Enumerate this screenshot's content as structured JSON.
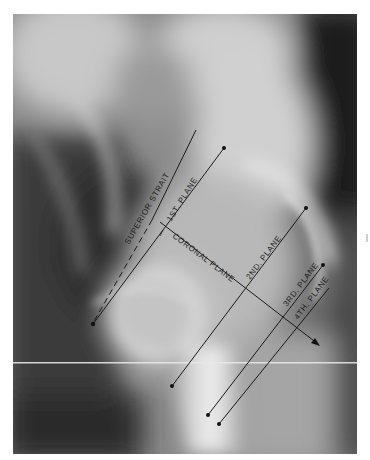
{
  "figure": {
    "type": "radiograph",
    "labels": {
      "superior_strait": "SUPERIOR STRAIT",
      "first_plane": "1ST. PLANE",
      "coronal_plane": "CORONAL PLANE",
      "second_plane": "2ND. PLANE",
      "third_plane": "3RD. PLANE",
      "fourth_plane": "4TH. PLANE"
    },
    "colors": {
      "annotation_line": "#1a1a1a",
      "label_text": "#1e1e1e",
      "background": "#ffffff"
    }
  }
}
